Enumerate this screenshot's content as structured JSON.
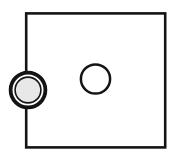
{
  "canvas": {
    "width": 176,
    "height": 159,
    "background_color": "#ffffff",
    "title": "Schematic line drawing: square plate with through-hole and edge-mounted ringed port"
  },
  "palette": {
    "stroke_color": "#141414",
    "plate_fill": "#ffffff",
    "hole_fill": "#ffffff",
    "port_fill": "#e8e8e8",
    "port_gap_fill": "#ffffff",
    "background": "#ffffff"
  },
  "shapes": {
    "plate": {
      "label": "square-plate",
      "type": "rectangle",
      "x": 26.2,
      "y": 13.4,
      "width": 139.0,
      "height": 134.0,
      "stroke_width": 2.6,
      "fill": "#ffffff",
      "stroke": "#141414"
    },
    "hole": {
      "label": "center-hole",
      "type": "circle",
      "cx": 95.5,
      "cy": 79.0,
      "r": 14.6,
      "stroke_width": 2.5,
      "fill": "#ffffff",
      "stroke": "#141414"
    },
    "port_outer_ring": {
      "label": "port-outer-ring",
      "type": "circle",
      "cx": 28.0,
      "cy": 90.0,
      "r": 17.4,
      "stroke_width": 3.8,
      "fill": "#ffffff",
      "stroke": "#141414"
    },
    "port_inner_ring": {
      "label": "port-inner-ring",
      "type": "circle",
      "cx": 28.0,
      "cy": 90.0,
      "r": 12.9,
      "stroke_width": 1.6,
      "fill": "#e8e8e8",
      "stroke": "#141414"
    }
  },
  "chart_data": {
    "type": "diagram",
    "elements": [
      {
        "name": "square-plate",
        "geometry": "rectangle",
        "x": 26.2,
        "y": 13.4,
        "width": 139.0,
        "height": 134.0,
        "fill": "#ffffff",
        "stroke": "#141414",
        "stroke_width": 2.6
      },
      {
        "name": "center-hole",
        "geometry": "circle",
        "cx": 95.5,
        "cy": 79.0,
        "r": 14.6,
        "fill": "#ffffff",
        "stroke": "#141414",
        "stroke_width": 2.5
      },
      {
        "name": "port-outer-ring",
        "geometry": "circle",
        "cx": 28.0,
        "cy": 90.0,
        "r": 17.4,
        "fill": "#ffffff",
        "stroke": "#141414",
        "stroke_width": 3.8
      },
      {
        "name": "port-inner-ring",
        "geometry": "circle",
        "cx": 28.0,
        "cy": 90.0,
        "r": 12.9,
        "fill": "#e8e8e8",
        "stroke": "#141414",
        "stroke_width": 1.6
      }
    ],
    "xlabel": "",
    "ylabel": "",
    "xlim": [
      0,
      176
    ],
    "ylim": [
      0,
      159
    ],
    "grid": false,
    "legend": false,
    "annotations": []
  }
}
